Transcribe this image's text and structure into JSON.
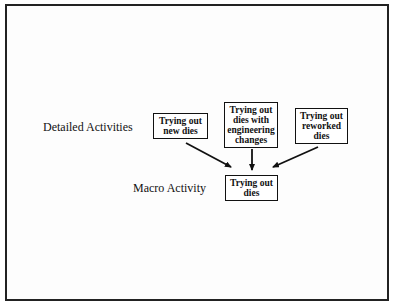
{
  "diagram": {
    "levels": {
      "detailed_label": "Detailed Activities",
      "macro_label": "Macro Activity"
    },
    "detailed_activities": [
      {
        "lines": [
          "Trying out",
          "new dies"
        ]
      },
      {
        "lines": [
          "Trying out",
          "dies with",
          "engineering",
          "changes"
        ]
      },
      {
        "lines": [
          "Trying out",
          "reworked",
          "dies"
        ]
      }
    ],
    "macro_activity": {
      "lines": [
        "Trying out",
        "dies"
      ]
    },
    "edges": [
      {
        "from": "detailed_activities.0",
        "to": "macro_activity"
      },
      {
        "from": "detailed_activities.1",
        "to": "macro_activity"
      },
      {
        "from": "detailed_activities.2",
        "to": "macro_activity"
      }
    ],
    "colors": {
      "line": "#111111",
      "background": "#ffffff",
      "frame": "#222222"
    }
  }
}
